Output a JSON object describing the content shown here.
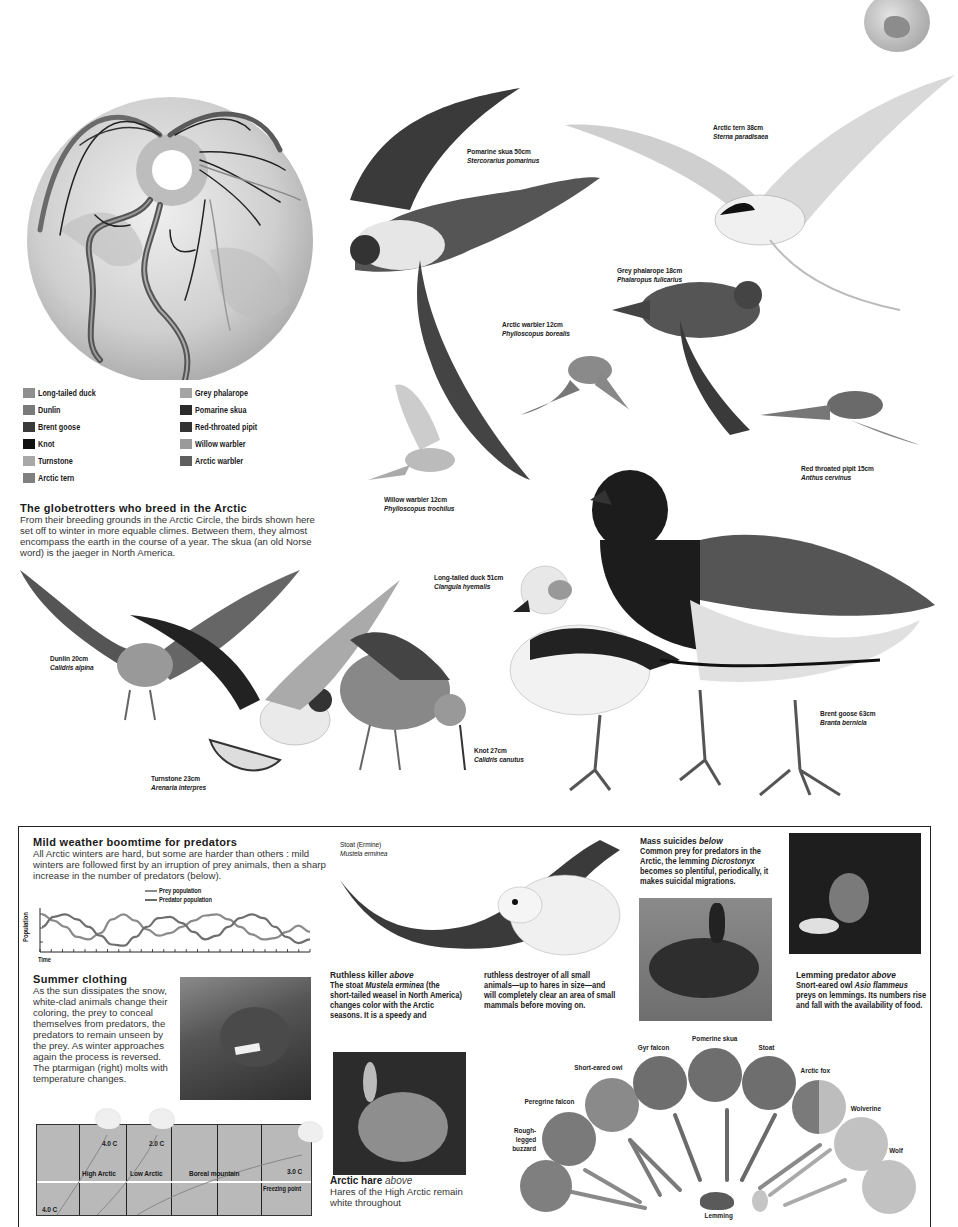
{
  "globe_map": {
    "legend": [
      {
        "label": "Long-tailed duck",
        "color": "#8f8f8f"
      },
      {
        "label": "Dunlin",
        "color": "#7a7a7a"
      },
      {
        "label": "Brent goose",
        "color": "#3a3a3a"
      },
      {
        "label": "Knot",
        "color": "#111111"
      },
      {
        "label": "Turnstone",
        "color": "#a8a8a8"
      },
      {
        "label": "Arctic tern",
        "color": "#808080"
      },
      {
        "label": "Grey phalarope",
        "color": "#a4a4a4"
      },
      {
        "label": "Pomarine skua",
        "color": "#2a2a2a"
      },
      {
        "label": "Red-throated pipit",
        "color": "#333333"
      },
      {
        "label": "Willow warbler",
        "color": "#9a9a9a"
      },
      {
        "label": "Arctic warbler",
        "color": "#5e5e5e"
      }
    ]
  },
  "globetrotters": {
    "title": "The globetrotters who breed in the Arctic",
    "body": "From their breeding grounds in the Arctic Circle, the birds shown here set off to winter in more equable climes. Between them, they almost encompass the earth in the course of a year. The skua (an old Norse word) is the jaeger in North America."
  },
  "birds": [
    {
      "id": "pomarine-skua",
      "name": "Pomarine skua 50cm",
      "sci": "Stercorarius pomarinus"
    },
    {
      "id": "arctic-tern",
      "name": "Arctic tern 38cm",
      "sci": "Sterna paradisaea"
    },
    {
      "id": "grey-phalarope",
      "name": "Grey phalarope 18cm",
      "sci": "Phalaropus fulicarius"
    },
    {
      "id": "arctic-warbler",
      "name": "Arctic warbler 12cm",
      "sci": "Phylloscopus borealis"
    },
    {
      "id": "red-throated-pipit",
      "name": "Red throated pipit 15cm",
      "sci": "Anthus cervinus"
    },
    {
      "id": "willow-warbler",
      "name": "Willow warbler 12cm",
      "sci": "Phylloscopus trochilus"
    },
    {
      "id": "long-tailed-duck",
      "name": "Long-tailed duck 51cm",
      "sci": "Clangula hyemalis"
    },
    {
      "id": "dunlin",
      "name": "Dunlin 20cm",
      "sci": "Calidris alpina"
    },
    {
      "id": "turnstone",
      "name": "Turnstone 23cm",
      "sci": "Arenaria interpres"
    },
    {
      "id": "knot",
      "name": "Knot 27cm",
      "sci": "Calidris canutus"
    },
    {
      "id": "brent-goose",
      "name": "Brent goose 63cm",
      "sci": "Branta bernicla"
    }
  ],
  "predators_box": {
    "title": "Mild weather boomtime for predators",
    "body": "All Arctic winters are hard, but some are harder than others : mild winters are followed first by an irruption of prey animals, then a sharp increase in the number of predators (below).",
    "chart": {
      "legend": [
        "Prey population",
        "Predator population"
      ],
      "ylabel": "Population",
      "xlabel": "Time"
    }
  },
  "chart_data": {
    "type": "line",
    "xlabel": "Time",
    "ylabel": "Population",
    "x": [
      0,
      1,
      2,
      3,
      4,
      5,
      6,
      7,
      8,
      9,
      10,
      11,
      12,
      13,
      14,
      15,
      16,
      17,
      18,
      19,
      20,
      21,
      22,
      23
    ],
    "series": [
      {
        "name": "Prey population",
        "values": [
          3,
          2.5,
          2,
          1.2,
          1,
          1.5,
          2.6,
          3,
          2.5,
          1.8,
          1.3,
          1.5,
          2,
          2.5,
          2.9,
          3,
          2.6,
          2,
          1.4,
          1,
          1.1,
          1.6,
          2.1,
          1.6
        ]
      },
      {
        "name": "Predator population",
        "values": [
          2,
          2.8,
          3,
          2.6,
          2,
          1.3,
          0.6,
          0.5,
          1.2,
          2,
          2.7,
          2.8,
          2.3,
          1.6,
          1,
          1.3,
          2,
          2.7,
          3,
          2.7,
          2,
          1.2,
          0.7,
          1
        ]
      }
    ],
    "ylim": [
      0,
      3.5
    ],
    "grid": false,
    "legend_position": "top-center"
  },
  "summer_clothing": {
    "title": "Summer clothing",
    "body": "As the sun dissipates the snow, white-clad animals change their coloring, the prey to conceal themselves from predators, the predators to remain unseen by the prey. As winter approaches again the process is reversed. The ptarmigan (right) molts with temperature changes."
  },
  "temperature_chart": {
    "zones": [
      "High Arctic",
      "Low Arctic",
      "Boreal mountain"
    ],
    "labels": [
      "4.0 C",
      "2.0 C",
      "3.0 C",
      "4.0 C"
    ],
    "freezing_label": "Freezing point"
  },
  "stoat": {
    "label": "Stoat (Ermine)",
    "sci": "Mustela erminea",
    "title": "Ruthless killer",
    "title_suffix": "above",
    "body_pre": "The stoat ",
    "body_sci": "Mustela erminea",
    "body_post": " (the short-tailed weasel in North America) changes color with the Arctic seasons. It is a speedy and",
    "body_col2": "ruthless destroyer of all small animals—up to hares in size—and will completely clear an area of small mammals before moving on."
  },
  "mass_suicides": {
    "title": "Mass suicides",
    "title_suffix": "below",
    "body_pre": "Common prey for predators in the Arctic, the lemming ",
    "body_sci": "Dicrostonyx",
    "body_post": " becomes so plentiful, periodically, it makes suicidal migrations."
  },
  "lemming_predator": {
    "title": "Lemming predator",
    "title_suffix": "above",
    "body_pre": "Snort-eared owl ",
    "body_sci": "Asio flammeus",
    "body_post": " preys on lemmings. Its numbers rise and fall with the availability of food."
  },
  "arctic_hare": {
    "title": "Arctic hare",
    "title_suffix": "above",
    "body": "Hares of the High Arctic remain white throughout"
  },
  "food_web": {
    "predators": [
      {
        "label": "Rough-legged buzzard"
      },
      {
        "label": "Peregrine falcon"
      },
      {
        "label": "Short-eared owl"
      },
      {
        "label": "Gyr falcon"
      },
      {
        "label": "Pomerine skua"
      },
      {
        "label": "Stoat"
      },
      {
        "label": "Arctic fox"
      },
      {
        "label": "Wolverine"
      },
      {
        "label": "Wolf"
      }
    ],
    "prey_label": "Lemming"
  }
}
